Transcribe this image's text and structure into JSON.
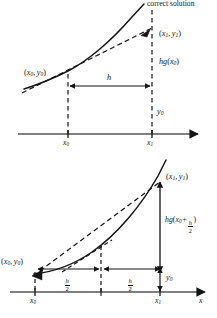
{
  "figure": {
    "background_color": "#ffffff",
    "ink_color": "#141414"
  },
  "top_diagram": {
    "name": "euler-step-diagram",
    "labels": {
      "correct_solution": "correct solution",
      "point_start": "(x₀, y₀)",
      "point_end": "(x₁, y₁)",
      "increment": "hg(x₀)",
      "step_width": "h",
      "y_initial": "y₀",
      "tick_x0": "x₀",
      "tick_x1": "x₁"
    },
    "parts": {
      "correct_solution_text": "correct solution",
      "start_point_text": "(x",
      "increment_head": "hg(x",
      "step_label": "h",
      "y_initial_text": "y"
    }
  },
  "bottom_diagram": {
    "name": "midpoint-step-diagram",
    "labels": {
      "point_start": "(x₀, y₀)",
      "point_end": "(x₁, y₁)",
      "increment": "hg(x₀ + h/2)",
      "half_step_left": "h/2",
      "half_step_right": "h/2",
      "y_initial": "y₀",
      "tick_x0": "x₀",
      "tick_x1": "x₁",
      "axis_x": "x"
    }
  },
  "symbols": {
    "x": "x",
    "y": "y",
    "h": "h",
    "g": "g",
    "zero": "0",
    "one": "1",
    "two": "2",
    "plus": "+",
    "comma": ",",
    "open_paren": "(",
    "close_paren": ")"
  }
}
